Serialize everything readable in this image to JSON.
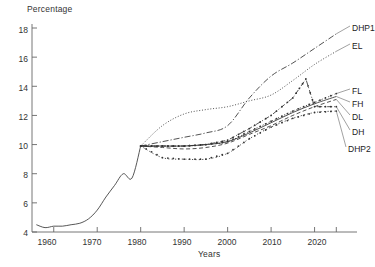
{
  "chart_data": {
    "type": "line",
    "title": "",
    "xlabel": "Years",
    "ylabel": "Percentage",
    "xlim": [
      1955,
      2027
    ],
    "ylim": [
      4,
      18
    ],
    "xticks": [
      1960,
      1970,
      1980,
      1990,
      2000,
      2010,
      2020
    ],
    "yticks": [
      4,
      6,
      8,
      10,
      12,
      14,
      16,
      18
    ],
    "grid": false,
    "legend_position": "right-inline",
    "history": {
      "name": "historical",
      "x": [
        1956,
        1958,
        1960,
        1962,
        1964,
        1966,
        1968,
        1970,
        1972,
        1974,
        1976,
        1978,
        1980
      ],
      "y": [
        4.5,
        4.3,
        4.4,
        4.4,
        4.5,
        4.6,
        4.9,
        5.5,
        6.4,
        7.2,
        8.0,
        7.7,
        9.9
      ]
    },
    "series": [
      {
        "name": "DHP1",
        "style": "dash-dot",
        "x": [
          1980,
          1985,
          1990,
          1995,
          2000,
          2005,
          2010,
          2015,
          2020,
          2025
        ],
        "y": [
          9.9,
          10.2,
          10.5,
          10.8,
          11.3,
          13.2,
          14.7,
          15.6,
          16.6,
          17.6
        ]
      },
      {
        "name": "EL",
        "style": "dotted",
        "x": [
          1980,
          1985,
          1990,
          1995,
          2000,
          2005,
          2010,
          2015,
          2020,
          2025
        ],
        "y": [
          9.9,
          11.3,
          12.1,
          12.4,
          12.6,
          13.0,
          13.4,
          14.4,
          15.5,
          16.4
        ]
      },
      {
        "name": "FL",
        "style": "dotted-marker",
        "x": [
          1980,
          1985,
          1990,
          1995,
          2000,
          2005,
          2010,
          2015,
          2020,
          2025
        ],
        "y": [
          9.9,
          9.9,
          9.9,
          10.0,
          10.2,
          10.9,
          11.6,
          12.3,
          12.9,
          13.5
        ]
      },
      {
        "name": "FH",
        "style": "solid",
        "x": [
          1980,
          1985,
          1990,
          1995,
          2000,
          2005,
          2010,
          2015,
          2020,
          2025
        ],
        "y": [
          9.9,
          9.9,
          9.9,
          10.0,
          10.2,
          10.8,
          11.5,
          12.2,
          12.8,
          13.3
        ]
      },
      {
        "name": "DL",
        "style": "dashed",
        "x": [
          1980,
          1985,
          1990,
          1995,
          2000,
          2005,
          2010,
          2015,
          2020,
          2025
        ],
        "y": [
          9.9,
          9.8,
          9.7,
          9.8,
          10.1,
          10.7,
          11.3,
          12.0,
          12.6,
          13.1
        ]
      },
      {
        "name": "DH",
        "style": "dash-dot-marker",
        "x": [
          1980,
          1985,
          1990,
          1995,
          2000,
          2005,
          2010,
          2015,
          2018,
          2020,
          2025
        ],
        "y": [
          9.9,
          9.9,
          9.9,
          10.0,
          10.3,
          11.1,
          12.0,
          13.2,
          14.5,
          12.6,
          12.6
        ]
      },
      {
        "name": "DHP2",
        "style": "dotted-marker",
        "x": [
          1980,
          1985,
          1990,
          1995,
          2000,
          2005,
          2010,
          2015,
          2020,
          2025
        ],
        "y": [
          9.9,
          9.1,
          9.0,
          9.0,
          9.4,
          10.4,
          11.2,
          11.8,
          12.2,
          12.3
        ]
      }
    ]
  },
  "labels": {
    "dhp1": "DHP1",
    "el": "EL",
    "fl": "FL",
    "fh": "FH",
    "dl": "DL",
    "dh": "DH",
    "dhp2": "DHP2"
  },
  "axis": {
    "y_title": "Percentage",
    "x_title": "Years",
    "y_ticks": [
      "18",
      "16",
      "14",
      "12",
      "10",
      "8",
      "6",
      "4"
    ],
    "x_ticks": [
      "1960",
      "1970",
      "1980",
      "1990",
      "2000",
      "2010",
      "2020"
    ]
  }
}
